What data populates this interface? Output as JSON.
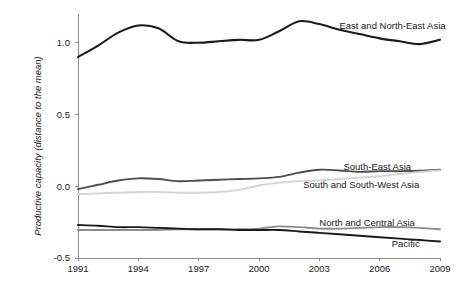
{
  "chart_data": {
    "type": "line",
    "title": "",
    "xlabel": "",
    "ylabel": "Productive capacity (distance to the mean)",
    "xlim": [
      1991,
      2009
    ],
    "ylim": [
      -0.5,
      1.2
    ],
    "grid": false,
    "legend_position": "inline-right-of-lines",
    "x_ticks": [
      "1991",
      "1994",
      "1997",
      "2000",
      "2003",
      "2006",
      "2009"
    ],
    "x_tick_values": [
      1991,
      1994,
      1997,
      2000,
      2003,
      2006,
      2009
    ],
    "y_ticks": [
      "-0.5",
      "0.0",
      "0.5",
      "1.0"
    ],
    "y_tick_values": [
      -0.5,
      0.0,
      0.5,
      1.0
    ],
    "x": [
      1991,
      1992,
      1993,
      1994,
      1995,
      1996,
      1997,
      1998,
      1999,
      2000,
      2001,
      2002,
      2003,
      2004,
      2005,
      2006,
      2007,
      2008,
      2009
    ],
    "series": [
      {
        "name": "East and North-East Asia",
        "color": "#1a1a1a",
        "width": 2.1,
        "label_x": 2004.0,
        "label_y": 1.12,
        "values": [
          0.9,
          0.98,
          1.07,
          1.12,
          1.1,
          1.01,
          1.0,
          1.01,
          1.02,
          1.02,
          1.08,
          1.15,
          1.13,
          1.09,
          1.06,
          1.03,
          1.01,
          0.99,
          1.02
        ]
      },
      {
        "name": "South-East Asia",
        "color": "#4d4d4d",
        "width": 1.9,
        "label_x": 2004.2,
        "label_y": 0.14,
        "values": [
          -0.02,
          0.01,
          0.04,
          0.055,
          0.05,
          0.035,
          0.04,
          0.045,
          0.05,
          0.055,
          0.065,
          0.095,
          0.115,
          0.11,
          0.1,
          0.105,
          0.105,
          0.108,
          0.115
        ]
      },
      {
        "name": "South and South-West Asia",
        "color": "#d4d4d4",
        "width": 1.9,
        "label_x": 2002.2,
        "label_y": 0.01,
        "values": [
          -0.055,
          -0.05,
          -0.045,
          -0.04,
          -0.04,
          -0.045,
          -0.045,
          -0.04,
          -0.025,
          0.005,
          0.025,
          0.035,
          0.04,
          0.05,
          0.06,
          0.07,
          0.085,
          0.1,
          0.11
        ]
      },
      {
        "name": "North and Central Asia",
        "color": "#8c8c8c",
        "width": 1.9,
        "label_x": 2003.0,
        "label_y": -0.255,
        "values": [
          -0.305,
          -0.305,
          -0.305,
          -0.305,
          -0.305,
          -0.3,
          -0.3,
          -0.3,
          -0.3,
          -0.295,
          -0.28,
          -0.285,
          -0.295,
          -0.295,
          -0.29,
          -0.285,
          -0.285,
          -0.29,
          -0.3
        ]
      },
      {
        "name": "Pacific",
        "color": "#1a1a1a",
        "width": 1.9,
        "label_x": 2006.6,
        "label_y": -0.4,
        "values": [
          -0.27,
          -0.275,
          -0.285,
          -0.285,
          -0.29,
          -0.295,
          -0.3,
          -0.3,
          -0.305,
          -0.305,
          -0.305,
          -0.315,
          -0.325,
          -0.335,
          -0.345,
          -0.355,
          -0.365,
          -0.375,
          -0.385
        ]
      }
    ]
  }
}
